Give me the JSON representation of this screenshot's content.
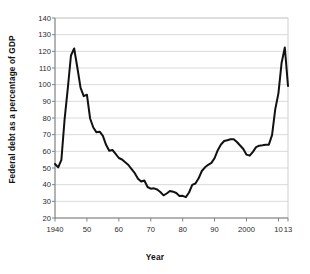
{
  "chart_data": {
    "type": "line",
    "title": "",
    "xlabel": "Year",
    "ylabel": "Federal debt as a percentage of GDP",
    "xlim": [
      1940,
      2013
    ],
    "ylim": [
      20,
      140
    ],
    "grid": true,
    "legend": "none",
    "line_color": "#111111",
    "grid_color": "#cfcfcf",
    "axis_color": "#808080",
    "background": "#ffffff",
    "y_ticks": [
      20,
      30,
      40,
      50,
      60,
      70,
      80,
      90,
      100,
      110,
      120,
      130,
      140
    ],
    "y_tick_labels": [
      "20",
      "30",
      "40",
      "50",
      "60",
      "70",
      "80",
      "90",
      "100",
      "110",
      "120",
      "130",
      "140"
    ],
    "x_ticks": [
      1940,
      1950,
      1960,
      1970,
      1980,
      1990,
      2000,
      2010,
      2013
    ],
    "x_tick_labels": [
      "1940",
      "50",
      "60",
      "70",
      "80",
      "90",
      "2000",
      "10",
      "13"
    ],
    "series": [
      {
        "name": "Federal debt as a percentage of GDP",
        "x": [
          1940,
          1941,
          1942,
          1943,
          1944,
          1945,
          1946,
          1947,
          1948,
          1949,
          1950,
          1951,
          1952,
          1953,
          1954,
          1955,
          1956,
          1957,
          1958,
          1959,
          1960,
          1961,
          1962,
          1963,
          1964,
          1965,
          1966,
          1967,
          1968,
          1969,
          1970,
          1971,
          1972,
          1973,
          1974,
          1975,
          1976,
          1977,
          1978,
          1979,
          1980,
          1981,
          1982,
          1983,
          1984,
          1985,
          1986,
          1987,
          1988,
          1989,
          1990,
          1991,
          1992,
          1993,
          1994,
          1995,
          1996,
          1997,
          1998,
          1999,
          2000,
          2001,
          2002,
          2003,
          2004,
          2005,
          2006,
          2007,
          2008,
          2009,
          2010,
          2011,
          2012,
          2013
        ],
        "values": [
          52.4,
          50.4,
          54.9,
          79.1,
          97.6,
          117.5,
          121.7,
          110.3,
          98.2,
          93.1,
          94.0,
          79.7,
          74.3,
          71.4,
          71.8,
          69.3,
          63.9,
          60.4,
          60.8,
          58.5,
          56.0,
          55.1,
          53.4,
          51.8,
          49.3,
          46.9,
          43.6,
          41.9,
          42.5,
          38.6,
          37.6,
          37.8,
          37.1,
          35.6,
          33.6,
          34.7,
          36.2,
          35.8,
          35.0,
          33.2,
          33.3,
          32.5,
          35.3,
          39.9,
          40.7,
          43.8,
          48.2,
          50.4,
          51.9,
          53.1,
          55.9,
          60.7,
          64.1,
          66.2,
          66.7,
          67.2,
          67.3,
          65.6,
          63.5,
          61.4,
          58.0,
          57.4,
          59.7,
          62.5,
          63.4,
          63.6,
          63.9,
          64.0,
          69.7,
          85.2,
          94.8,
          113.2,
          122.3,
          99.2
        ]
      }
    ]
  },
  "axes": {
    "y_title": "Federal debt as a percentage of GDP",
    "x_title": "Year"
  }
}
